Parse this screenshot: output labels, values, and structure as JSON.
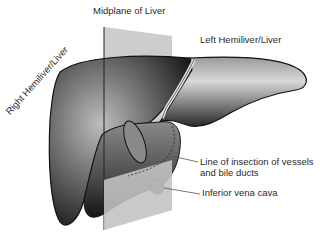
{
  "figure": {
    "labels": {
      "midplane": "Midplane of Liver",
      "left_hemiliver": "Left Hemiliver/Liver",
      "right_hemiliver": "Right Hemiliver/Liver",
      "insection_line_1": "Line of insection of vessels",
      "insection_line_2": "and bile ducts",
      "ivc": "Inferior vena cava"
    },
    "colors": {
      "background": "#ffffff",
      "plane": "#c8c8c8",
      "liver_dark": "#1e1e1e",
      "liver_mid": "#6e6e6e",
      "liver_light": "#d9d9d9",
      "leader": "#555555",
      "text": "#2a2a2a"
    }
  }
}
